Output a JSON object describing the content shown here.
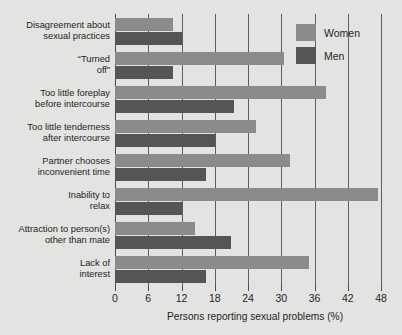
{
  "chart_data": {
    "type": "bar",
    "orientation": "horizontal",
    "title": "",
    "xlabel": "Persons reporting sexual problems (%)",
    "ylabel": "",
    "xlim": [
      0,
      48
    ],
    "xticks": [
      0,
      6,
      12,
      18,
      24,
      30,
      36,
      42,
      48
    ],
    "grid": "vertical",
    "legend_position": "top-right",
    "categories": [
      "Disagreement about\nsexual practices",
      "“Turned\noff”",
      "Too little foreplay\nbefore intercourse",
      "Too little tenderness\nafter intercourse",
      "Partner chooses\ninconvenient time",
      "Inability to\nrelax",
      "Attraction to person(s)\nother than mate",
      "Lack of\ninterest"
    ],
    "series": [
      {
        "name": "Women",
        "color": "#8b8b89",
        "values": [
          10.5,
          30.5,
          38,
          25.5,
          31.5,
          47.5,
          14.5,
          35
        ]
      },
      {
        "name": "Men",
        "color": "#555553",
        "values": [
          12,
          10.5,
          21.5,
          18,
          16.5,
          12,
          21,
          16.5
        ]
      }
    ]
  },
  "legend": {
    "items": [
      {
        "label": "Women",
        "color": "#8b8b89"
      },
      {
        "label": "Men",
        "color": "#555553"
      }
    ]
  },
  "axis": {
    "x_title": "Persons reporting sexual problems (%)",
    "tick_labels": [
      "0",
      "6",
      "12",
      "18",
      "24",
      "30",
      "36",
      "42",
      "48"
    ]
  },
  "colors": {
    "background": "#e3e3e1",
    "women": "#8b8b89",
    "men": "#555553",
    "gridline": "#5e5e5c",
    "text": "#1f1f1f"
  }
}
